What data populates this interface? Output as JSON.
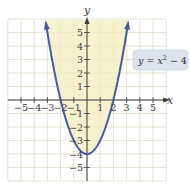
{
  "chart_data": {
    "type": "line",
    "title": "",
    "function": "y = x^2 - 4",
    "equation_label": "y = x² − 4",
    "equation_parts": {
      "y": "y",
      "eq": " = ",
      "x": "x",
      "exp": "2",
      "rest": " − 4"
    },
    "xlabel": "x",
    "ylabel": "y",
    "xlim": [
      -6,
      6
    ],
    "ylim": [
      -6,
      6
    ],
    "x_ticks": [
      -5,
      -4,
      -3,
      -2,
      -1,
      1,
      2,
      3,
      4,
      5
    ],
    "y_ticks": [
      5,
      4,
      3,
      2,
      1,
      -1,
      -2,
      -3,
      -4,
      -5
    ],
    "x_tick_labels": [
      "−5",
      "−4",
      "−3",
      "−2",
      "−1",
      "1",
      "2",
      "3",
      "4",
      "5"
    ],
    "y_tick_labels": [
      "5",
      "4",
      "3",
      "2",
      "1",
      "−1",
      "−2",
      "−3",
      "−4",
      "−5"
    ],
    "grid": true,
    "x_intercepts": [
      -2,
      2
    ],
    "vertex": [
      0,
      -4
    ],
    "series": [
      {
        "name": "y = x^2 - 4",
        "x": [
          -3.1,
          -3,
          -2.5,
          -2,
          -1.5,
          -1,
          -0.5,
          0,
          0.5,
          1,
          1.5,
          2,
          2.5,
          3,
          3.1
        ],
        "values": [
          5.61,
          5,
          2.25,
          0,
          -1.75,
          -3,
          -3.75,
          -4,
          -3.75,
          -3,
          -1.75,
          0,
          2.25,
          5,
          5.61
        ]
      }
    ],
    "shaded_region": "interior of parabola above the curve (y >= x^2 - 4)",
    "colors": {
      "curve": "#4a5a9a",
      "shade": "#f6f2cf",
      "grid": "#d8d8d8",
      "axis": "#3a3a3a",
      "label_box": "#dde3ea"
    }
  }
}
